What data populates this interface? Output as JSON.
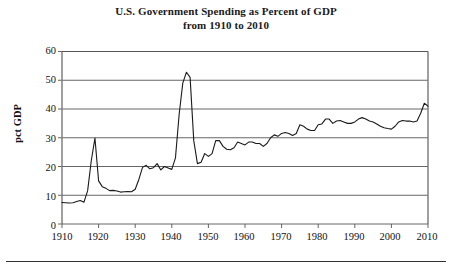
{
  "title": {
    "line1": "U.S. Government Spending as Percent of GDP",
    "line2": "from 1910 to 2010"
  },
  "axes": {
    "ylabel": "pct GDP",
    "yticks": [
      "0",
      "10",
      "20",
      "30",
      "40",
      "50",
      "60"
    ],
    "xticks": [
      "1910",
      "1920",
      "1930",
      "1940",
      "1950",
      "1960",
      "1970",
      "1980",
      "1990",
      "2000",
      "2010"
    ]
  },
  "colors": {
    "line": "#1a1a1a",
    "grid": "#555555",
    "frame": "#777777",
    "text": "#111111",
    "background": "#ffffff"
  },
  "chart_data": {
    "type": "line",
    "title": "U.S. Government Spending as Percent of GDP from 1910 to 2010",
    "xlabel": "",
    "ylabel": "pct GDP",
    "xlim": [
      1910,
      2010
    ],
    "ylim": [
      0,
      60
    ],
    "grid": true,
    "legend": false,
    "series": [
      {
        "name": "Total government spending (pct GDP)",
        "x": [
          1910,
          1911,
          1912,
          1913,
          1914,
          1915,
          1916,
          1917,
          1918,
          1919,
          1920,
          1921,
          1922,
          1923,
          1924,
          1925,
          1926,
          1927,
          1928,
          1929,
          1930,
          1931,
          1932,
          1933,
          1934,
          1935,
          1936,
          1937,
          1938,
          1939,
          1940,
          1941,
          1942,
          1943,
          1944,
          1945,
          1946,
          1947,
          1948,
          1949,
          1950,
          1951,
          1952,
          1953,
          1954,
          1955,
          1956,
          1957,
          1958,
          1959,
          1960,
          1961,
          1962,
          1963,
          1964,
          1965,
          1966,
          1967,
          1968,
          1969,
          1970,
          1971,
          1972,
          1973,
          1974,
          1975,
          1976,
          1977,
          1978,
          1979,
          1980,
          1981,
          1982,
          1983,
          1984,
          1985,
          1986,
          1987,
          1988,
          1989,
          1990,
          1991,
          1992,
          1993,
          1994,
          1995,
          1996,
          1997,
          1998,
          1999,
          2000,
          2001,
          2002,
          2003,
          2004,
          2005,
          2006,
          2007,
          2008,
          2009,
          2010
        ],
        "y": [
          7.5,
          7.4,
          7.3,
          7.4,
          7.8,
          8.2,
          7.6,
          11.5,
          22.0,
          29.9,
          15.0,
          13.0,
          12.4,
          11.6,
          11.7,
          11.5,
          11.1,
          11.2,
          11.3,
          11.2,
          12.1,
          15.5,
          19.7,
          20.4,
          19.2,
          19.6,
          21.0,
          18.8,
          20.0,
          19.5,
          19.0,
          23.0,
          38.0,
          49.0,
          52.8,
          51.0,
          29.0,
          21.0,
          21.5,
          24.5,
          23.5,
          24.5,
          29.0,
          29.0,
          27.0,
          26.0,
          25.8,
          26.5,
          28.5,
          28.0,
          27.5,
          28.5,
          28.5,
          28.0,
          28.0,
          27.0,
          28.0,
          30.0,
          31.0,
          30.5,
          31.5,
          31.8,
          31.5,
          30.8,
          31.5,
          34.5,
          34.0,
          33.0,
          32.5,
          32.5,
          34.5,
          34.8,
          36.5,
          36.5,
          35.0,
          35.8,
          36.0,
          35.5,
          35.0,
          35.0,
          35.5,
          36.5,
          37.0,
          36.5,
          35.8,
          35.5,
          34.8,
          34.0,
          33.5,
          33.2,
          33.0,
          34.0,
          35.5,
          36.0,
          35.8,
          35.8,
          35.5,
          35.8,
          38.5,
          42.0,
          41.0
        ]
      }
    ]
  }
}
